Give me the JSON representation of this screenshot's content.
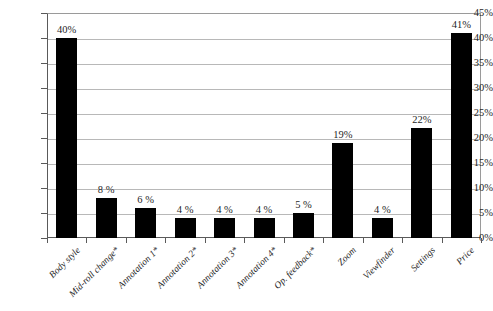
{
  "chart_data": {
    "type": "bar",
    "title": "",
    "subtitle": "",
    "xlabel": "",
    "ylabel": "",
    "grid": true,
    "legend": false,
    "ylim": [
      0,
      45
    ],
    "ytick_step": 5,
    "ytick_labels": [
      "0%",
      "5%",
      "10%",
      "15%",
      "20%",
      "25%",
      "30%",
      "35%",
      "40%",
      "45%"
    ],
    "ytick_values": [
      0,
      5,
      10,
      15,
      20,
      25,
      30,
      35,
      40,
      45
    ],
    "categories": [
      "Body style",
      "Mid-roll change*",
      "Annotation 1*",
      "Annotation 2*",
      "Annotation 3*",
      "Annotation 4*",
      "Op. feedback*",
      "Zoom",
      "Viewfinder",
      "Settings",
      "Price"
    ],
    "values": [
      40,
      8,
      6,
      4,
      4,
      4,
      5,
      19,
      4,
      22,
      41
    ],
    "data_labels": [
      "40%",
      "8 %",
      "6 %",
      "4 %",
      "4 %",
      "4 %",
      "5 %",
      "19%",
      "4 %",
      "22%",
      "41%"
    ],
    "bar_color": "#000000",
    "grid_color": "#b8b8b8",
    "axis_color": "#5a5a5a",
    "background_color": "#ffffff"
  }
}
